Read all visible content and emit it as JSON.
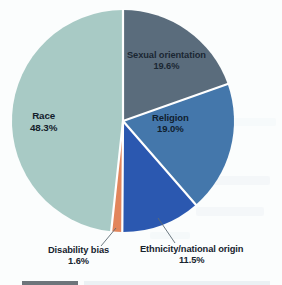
{
  "chart_data": {
    "type": "pie",
    "title": "",
    "subtitle": "",
    "xlabel": "",
    "ylabel": "",
    "grid": false,
    "legend_position": "none",
    "labels_inside_slices": [
      "Race",
      "Sexual orientation",
      "Religion"
    ],
    "labels_with_callouts": [
      "Disability bias",
      "Ethnicity/national origin"
    ],
    "start_angle_deg": 0,
    "direction": "clockwise",
    "units": "percent",
    "total": 100.0,
    "categories": [
      "Sexual orientation",
      "Religion",
      "Ethnicity/national origin",
      "Disability bias",
      "Race"
    ],
    "values": [
      19.6,
      19.0,
      11.5,
      1.6,
      48.3
    ],
    "value_labels": [
      "19.6%",
      "19.0%",
      "11.5%",
      "1.6%",
      "48.3%"
    ],
    "colors": [
      "#5a6c7c",
      "#4477ab",
      "#2b58b0",
      "#e2855b",
      "#a8cac5"
    ],
    "slices": [
      {
        "name": "Sexual orientation",
        "value": 19.6,
        "value_label": "19.6%",
        "color": "#5a6c7c",
        "label_placement": "inside"
      },
      {
        "name": "Religion",
        "value": 19.0,
        "value_label": "19.0%",
        "color": "#4477ab",
        "label_placement": "inside"
      },
      {
        "name": "Ethnicity/national origin",
        "value": 11.5,
        "value_label": "11.5%",
        "color": "#2b58b0",
        "label_placement": "callout"
      },
      {
        "name": "Disability bias",
        "value": 1.6,
        "value_label": "1.6%",
        "color": "#e2855b",
        "label_placement": "callout"
      },
      {
        "name": "Race",
        "value": 48.3,
        "value_label": "48.3%",
        "color": "#a8cac5",
        "label_placement": "inside"
      }
    ]
  },
  "style": {
    "background": "#fbfdfd",
    "slice_separator": "#ffffff",
    "label_text": "#16232e",
    "callout_line": "#5d6b74"
  },
  "footer": {
    "caption_swatch_visible": true
  }
}
